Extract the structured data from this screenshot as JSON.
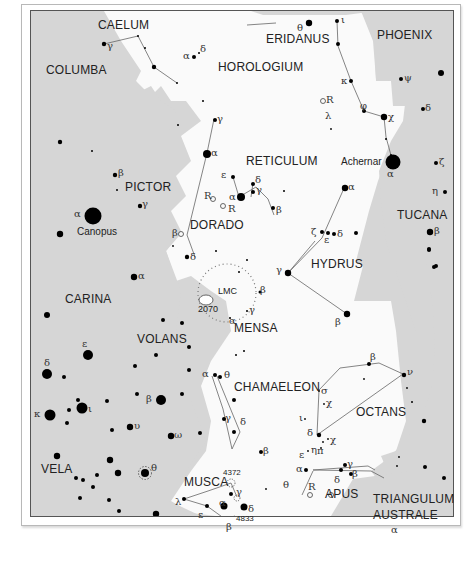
{
  "colors": {
    "background_outside": "#d6d6d6",
    "region_highlight": "#fafafa",
    "star": "#000000",
    "line": "#666666",
    "text": "#222222"
  },
  "constellations": [
    {
      "id": "caelum",
      "label": "CAELUM"
    },
    {
      "id": "eridanus",
      "label": "ERIDANUS"
    },
    {
      "id": "phoenix",
      "label": "PHOENIX"
    },
    {
      "id": "columba",
      "label": "COLUMBA"
    },
    {
      "id": "horologium",
      "label": "HOROLOGIUM"
    },
    {
      "id": "reticulum",
      "label": "RETICULUM"
    },
    {
      "id": "pictor",
      "label": "PICTOR"
    },
    {
      "id": "dorado",
      "label": "DORADO"
    },
    {
      "id": "tucana",
      "label": "TUCANA"
    },
    {
      "id": "hydrus",
      "label": "HYDRUS"
    },
    {
      "id": "carina",
      "label": "CARINA"
    },
    {
      "id": "mensa",
      "label": "MENSA"
    },
    {
      "id": "volans",
      "label": "VOLANS"
    },
    {
      "id": "chamaeleon",
      "label": "CHAMAELEON"
    },
    {
      "id": "octans",
      "label": "OCTANS"
    },
    {
      "id": "vela",
      "label": "VELA"
    },
    {
      "id": "musca",
      "label": "MUSCA"
    },
    {
      "id": "apus",
      "label": "APUS"
    },
    {
      "id": "triangulum_australe_1",
      "label": "TRIANGULUM"
    },
    {
      "id": "triangulum_australe_2",
      "label": "AUSTRALE"
    }
  ],
  "named_stars": {
    "canopus": "Canopus",
    "achernar": "Achernar"
  },
  "deep_sky": {
    "lmc": "LMC",
    "ngc2070": "2070",
    "ngc4372": "4372",
    "ngc4833": "4833"
  },
  "greek": {
    "alpha": "α",
    "beta": "β",
    "gamma": "γ",
    "delta": "δ",
    "epsilon": "ε",
    "zeta": "ζ",
    "eta": "η",
    "theta": "θ",
    "iota": "ι",
    "kappa": "κ",
    "lambda": "λ",
    "nu": "ν",
    "pi": "π",
    "sigma": "σ",
    "upsilon": "υ",
    "phi": "φ",
    "chi": "χ",
    "psi": "ψ",
    "omega": "ω",
    "R": "R"
  }
}
